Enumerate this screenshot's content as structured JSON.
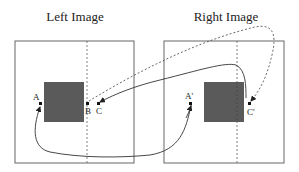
{
  "titles": {
    "left": "Left Image",
    "right": "Right Image"
  },
  "labels": {
    "A": "A",
    "B": "B",
    "C": "C",
    "A_prime": "A'",
    "C_prime": "C'"
  },
  "colors": {
    "frame": "#555555",
    "occluder": "#5a5a5a",
    "line": "#333333"
  }
}
